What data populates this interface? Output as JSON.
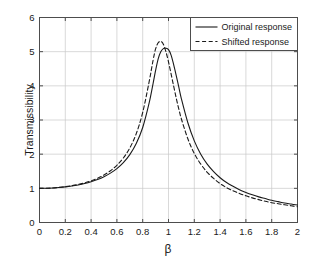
{
  "figure": {
    "background": "#ffffff",
    "axes_color": "#4d4d4d",
    "grid_color": "#c8c8c8",
    "curve_color": "#1a1a1a"
  },
  "chart_data": {
    "type": "line",
    "title": "",
    "xlabel": "β",
    "ylabel": "Transmissibility",
    "xlim": [
      0,
      2
    ],
    "ylim": [
      0,
      6
    ],
    "grid": true,
    "legend_position": "upper right",
    "xticks": [
      0,
      0.2,
      0.4,
      0.6,
      0.8,
      1,
      1.2,
      1.4,
      1.6,
      1.8,
      2
    ],
    "xticklabels": [
      "0",
      "0.2",
      "0.4",
      "0.6",
      "0.8",
      "1",
      "1.2",
      "1.4",
      "1.6",
      "1.8",
      "2"
    ],
    "yticks": [
      0,
      1,
      2,
      3,
      4,
      5,
      6
    ],
    "yticklabels": [
      "0",
      "1",
      "2",
      "3",
      "4",
      "5",
      "6"
    ],
    "x": [
      0,
      0.05,
      0.1,
      0.15,
      0.2,
      0.25,
      0.3,
      0.35,
      0.4,
      0.45,
      0.5,
      0.55,
      0.6,
      0.65,
      0.7,
      0.75,
      0.8,
      0.85,
      0.88,
      0.9,
      0.92,
      0.94,
      0.96,
      0.98,
      1.0,
      1.02,
      1.04,
      1.06,
      1.08,
      1.1,
      1.15,
      1.2,
      1.25,
      1.3,
      1.35,
      1.4,
      1.45,
      1.5,
      1.55,
      1.6,
      1.65,
      1.7,
      1.75,
      1.8,
      1.85,
      1.9,
      1.95,
      2.0
    ],
    "series": [
      {
        "name": "Original response",
        "style": "solid",
        "values": [
          1.0,
          1.002,
          1.01,
          1.023,
          1.042,
          1.067,
          1.1,
          1.142,
          1.194,
          1.259,
          1.341,
          1.445,
          1.578,
          1.752,
          1.986,
          2.31,
          2.78,
          3.5,
          4.06,
          4.45,
          4.79,
          5.0,
          5.09,
          5.1,
          5.06,
          4.9,
          4.62,
          4.3,
          3.96,
          3.62,
          2.92,
          2.39,
          2.0,
          1.71,
          1.49,
          1.31,
          1.17,
          1.06,
          0.96,
          0.88,
          0.81,
          0.75,
          0.7,
          0.65,
          0.61,
          0.57,
          0.54,
          0.51
        ]
      },
      {
        "name": "Shifted response",
        "style": "dashed",
        "values": [
          1.0,
          1.003,
          1.011,
          1.026,
          1.047,
          1.076,
          1.113,
          1.161,
          1.221,
          1.296,
          1.392,
          1.515,
          1.675,
          1.888,
          2.182,
          2.6,
          3.22,
          4.12,
          4.74,
          5.08,
          5.26,
          5.3,
          5.22,
          5.0,
          4.7,
          4.35,
          3.99,
          3.64,
          3.32,
          3.03,
          2.45,
          2.02,
          1.71,
          1.47,
          1.29,
          1.14,
          1.02,
          0.93,
          0.85,
          0.78,
          0.72,
          0.67,
          0.62,
          0.58,
          0.55,
          0.52,
          0.49,
          0.46
        ]
      }
    ]
  },
  "legend": {
    "entries": [
      {
        "label": "Original response",
        "style": "solid"
      },
      {
        "label": "Shifted response",
        "style": "dashed"
      }
    ]
  }
}
